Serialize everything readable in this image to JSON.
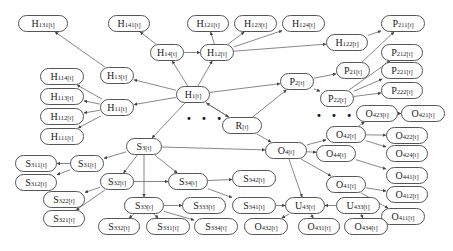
{
  "diagram": {
    "type": "hierarchical-state-graph",
    "nodes": [
      {
        "id": "H131",
        "base": "H",
        "sub": "131[t]",
        "x": 18,
        "y": 15,
        "w": 50,
        "h": 17
      },
      {
        "id": "H141",
        "base": "H",
        "sub": "141[t]",
        "x": 108,
        "y": 15,
        "w": 42,
        "h": 17
      },
      {
        "id": "H121",
        "base": "H",
        "sub": "121[t]",
        "x": 187,
        "y": 15,
        "w": 42,
        "h": 17
      },
      {
        "id": "H123",
        "base": "H",
        "sub": "123[t]",
        "x": 234,
        "y": 15,
        "w": 43,
        "h": 17
      },
      {
        "id": "H124",
        "base": "H",
        "sub": "124[t]",
        "x": 282,
        "y": 15,
        "w": 43,
        "h": 17
      },
      {
        "id": "P211",
        "base": "P",
        "sub": "211[t]",
        "x": 381,
        "y": 15,
        "w": 44,
        "h": 17
      },
      {
        "id": "H14",
        "base": "H",
        "sub": "14[t]",
        "x": 150,
        "y": 44,
        "w": 34,
        "h": 17
      },
      {
        "id": "H12",
        "base": "H",
        "sub": "12[t]",
        "x": 200,
        "y": 44,
        "w": 34,
        "h": 17
      },
      {
        "id": "H122",
        "base": "H",
        "sub": "122[t]",
        "x": 326,
        "y": 34,
        "w": 42,
        "h": 17
      },
      {
        "id": "P212",
        "base": "P",
        "sub": "212[t]",
        "x": 381,
        "y": 44,
        "w": 42,
        "h": 17
      },
      {
        "id": "H114",
        "base": "H",
        "sub": "114[t]",
        "x": 40,
        "y": 68,
        "w": 44,
        "h": 17
      },
      {
        "id": "H13",
        "base": "H",
        "sub": "13[t]",
        "x": 100,
        "y": 67,
        "w": 34,
        "h": 17
      },
      {
        "id": "P2",
        "base": "P",
        "sub": "2[t]",
        "x": 280,
        "y": 73,
        "w": 34,
        "h": 17
      },
      {
        "id": "P21",
        "base": "P",
        "sub": "21[t]",
        "x": 336,
        "y": 62,
        "w": 34,
        "h": 17
      },
      {
        "id": "P221",
        "base": "P",
        "sub": "221[t]",
        "x": 381,
        "y": 62,
        "w": 42,
        "h": 17
      },
      {
        "id": "H113",
        "base": "H",
        "sub": "113[t]",
        "x": 40,
        "y": 88,
        "w": 44,
        "h": 17
      },
      {
        "id": "H1",
        "base": "H",
        "sub": "1[t]",
        "x": 176,
        "y": 86,
        "w": 34,
        "h": 17
      },
      {
        "id": "P22",
        "base": "P",
        "sub": "22[t]",
        "x": 320,
        "y": 90,
        "w": 34,
        "h": 17
      },
      {
        "id": "P222",
        "base": "P",
        "sub": "222[t]",
        "x": 381,
        "y": 82,
        "w": 42,
        "h": 17
      },
      {
        "id": "H112",
        "base": "H",
        "sub": "112[t]",
        "x": 40,
        "y": 108,
        "w": 44,
        "h": 17
      },
      {
        "id": "H11",
        "base": "H",
        "sub": "11[t]",
        "x": 100,
        "y": 99,
        "w": 34,
        "h": 17
      },
      {
        "id": "O423",
        "base": "O",
        "sub": "423[t]",
        "x": 356,
        "y": 105,
        "w": 42,
        "h": 17
      },
      {
        "id": "O421",
        "base": "O",
        "sub": "421[t]",
        "x": 401,
        "y": 105,
        "w": 44,
        "h": 17
      },
      {
        "id": "H111",
        "base": "H",
        "sub": "111[t]",
        "x": 40,
        "y": 128,
        "w": 44,
        "h": 17
      },
      {
        "id": "R",
        "base": "R",
        "sub": "[t]",
        "x": 222,
        "y": 117,
        "w": 40,
        "h": 17
      },
      {
        "id": "O42",
        "base": "O",
        "sub": "42[t]",
        "x": 326,
        "y": 126,
        "w": 40,
        "h": 17
      },
      {
        "id": "O422",
        "base": "O",
        "sub": "422[t]",
        "x": 386,
        "y": 127,
        "w": 42,
        "h": 17
      },
      {
        "id": "S3",
        "base": "S",
        "sub": "3[t]",
        "x": 126,
        "y": 138,
        "w": 36,
        "h": 17
      },
      {
        "id": "O4",
        "base": "O",
        "sub": "4[t]",
        "x": 265,
        "y": 142,
        "w": 42,
        "h": 17
      },
      {
        "id": "O44",
        "base": "O",
        "sub": "44[t]",
        "x": 316,
        "y": 145,
        "w": 40,
        "h": 17
      },
      {
        "id": "O424",
        "base": "O",
        "sub": "424[t]",
        "x": 386,
        "y": 145,
        "w": 42,
        "h": 17
      },
      {
        "id": "S311",
        "base": "S",
        "sub": "311[t]",
        "x": 15,
        "y": 155,
        "w": 42,
        "h": 17
      },
      {
        "id": "S31",
        "base": "S",
        "sub": "31[t]",
        "x": 70,
        "y": 155,
        "w": 34,
        "h": 17
      },
      {
        "id": "O441",
        "base": "O",
        "sub": "441[t]",
        "x": 386,
        "y": 167,
        "w": 42,
        "h": 17
      },
      {
        "id": "S312",
        "base": "S",
        "sub": "312[t]",
        "x": 15,
        "y": 174,
        "w": 42,
        "h": 17
      },
      {
        "id": "S32",
        "base": "S",
        "sub": "32[t]",
        "x": 100,
        "y": 173,
        "w": 34,
        "h": 17
      },
      {
        "id": "S34",
        "base": "S",
        "sub": "34[t]",
        "x": 168,
        "y": 173,
        "w": 40,
        "h": 17
      },
      {
        "id": "S342",
        "base": "S",
        "sub": "342[t]",
        "x": 232,
        "y": 170,
        "w": 44,
        "h": 17
      },
      {
        "id": "O41",
        "base": "O",
        "sub": "41[t]",
        "x": 326,
        "y": 176,
        "w": 40,
        "h": 17
      },
      {
        "id": "O412",
        "base": "O",
        "sub": "412[t]",
        "x": 386,
        "y": 186,
        "w": 42,
        "h": 17
      },
      {
        "id": "S322",
        "base": "S",
        "sub": "322[t]",
        "x": 43,
        "y": 191,
        "w": 42,
        "h": 17
      },
      {
        "id": "S321",
        "base": "S",
        "sub": "321[t]",
        "x": 43,
        "y": 210,
        "w": 42,
        "h": 17
      },
      {
        "id": "S33",
        "base": "S",
        "sub": "33[t]",
        "x": 124,
        "y": 197,
        "w": 40,
        "h": 17
      },
      {
        "id": "S333",
        "base": "S",
        "sub": "333[t]",
        "x": 182,
        "y": 197,
        "w": 44,
        "h": 17
      },
      {
        "id": "S341",
        "base": "S",
        "sub": "341[t]",
        "x": 232,
        "y": 197,
        "w": 44,
        "h": 17
      },
      {
        "id": "U43",
        "base": "U",
        "sub": "43[t]",
        "x": 285,
        "y": 197,
        "w": 40,
        "h": 17
      },
      {
        "id": "U433",
        "base": "U",
        "sub": "433[t]",
        "x": 336,
        "y": 197,
        "w": 44,
        "h": 17
      },
      {
        "id": "O411",
        "base": "O",
        "sub": "411[t]",
        "x": 381,
        "y": 208,
        "w": 44,
        "h": 17
      },
      {
        "id": "S332",
        "base": "S",
        "sub": "332[t]",
        "x": 98,
        "y": 218,
        "w": 42,
        "h": 17
      },
      {
        "id": "S331",
        "base": "S",
        "sub": "331[t]",
        "x": 146,
        "y": 218,
        "w": 44,
        "h": 17
      },
      {
        "id": "S334",
        "base": "S",
        "sub": "334[t]",
        "x": 194,
        "y": 218,
        "w": 44,
        "h": 17
      },
      {
        "id": "O432",
        "base": "O",
        "sub": "432[t]",
        "x": 244,
        "y": 218,
        "w": 44,
        "h": 17
      },
      {
        "id": "O431",
        "base": "O",
        "sub": "431[t]",
        "x": 298,
        "y": 218,
        "w": 42,
        "h": 17
      },
      {
        "id": "O434",
        "base": "O",
        "sub": "434[t]",
        "x": 344,
        "y": 218,
        "w": 44,
        "h": 17
      }
    ],
    "ellipses": [
      {
        "id": "dots-left",
        "text": "• • •",
        "x": 186,
        "y": 113
      },
      {
        "id": "dots-right",
        "text": "• • •",
        "x": 316,
        "y": 110
      }
    ],
    "edges": [
      [
        "H13",
        "H131"
      ],
      [
        "H14",
        "H141"
      ],
      [
        "H1",
        "H14"
      ],
      [
        "H14",
        "H12"
      ],
      [
        "H12",
        "H121"
      ],
      [
        "H12",
        "H123"
      ],
      [
        "H12",
        "H124"
      ],
      [
        "H12",
        "H122"
      ],
      [
        "H122",
        "P211"
      ],
      [
        "H1",
        "H12"
      ],
      [
        "H1",
        "H13"
      ],
      [
        "H11",
        "H114"
      ],
      [
        "H11",
        "H113"
      ],
      [
        "H11",
        "H112"
      ],
      [
        "H11",
        "H111"
      ],
      [
        "H1",
        "H11"
      ],
      [
        "H1",
        "P2"
      ],
      [
        "P2",
        "P21"
      ],
      [
        "P2",
        "P22"
      ],
      [
        "P21",
        "P211"
      ],
      [
        "P22",
        "P212"
      ],
      [
        "P22",
        "P221"
      ],
      [
        "P22",
        "P222"
      ],
      [
        "R",
        "H1"
      ],
      [
        "H1",
        "R"
      ],
      [
        "R",
        "P2"
      ],
      [
        "R",
        "O4"
      ],
      [
        "O4",
        "O42"
      ],
      [
        "O4",
        "O44"
      ],
      [
        "O4",
        "O41"
      ],
      [
        "O42",
        "O423"
      ],
      [
        "O423",
        "O421"
      ],
      [
        "O42",
        "O422"
      ],
      [
        "O42",
        "O424"
      ],
      [
        "O44",
        "O441"
      ],
      [
        "O41",
        "O412"
      ],
      [
        "O41",
        "O411"
      ],
      [
        "O4",
        "U43"
      ],
      [
        "U43",
        "O432"
      ],
      [
        "U43",
        "O431"
      ],
      [
        "U433",
        "U43"
      ],
      [
        "U433",
        "O434"
      ],
      [
        "S3",
        "S31"
      ],
      [
        "S3",
        "S32"
      ],
      [
        "S3",
        "S34"
      ],
      [
        "S3",
        "S33"
      ],
      [
        "S3",
        "O4"
      ],
      [
        "S31",
        "S311"
      ],
      [
        "S31",
        "S312"
      ],
      [
        "S32",
        "S322"
      ],
      [
        "S32",
        "S321"
      ],
      [
        "S32",
        "S34"
      ],
      [
        "S34",
        "S342"
      ],
      [
        "S34",
        "S341"
      ],
      [
        "S341",
        "U43"
      ],
      [
        "S33",
        "S333"
      ],
      [
        "S33",
        "S332"
      ],
      [
        "S33",
        "S331"
      ],
      [
        "S33",
        "S334"
      ],
      [
        "H1",
        "S3"
      ]
    ],
    "colors": {
      "edge": "#555555",
      "node_border": "#555555",
      "text": "#222222"
    }
  }
}
